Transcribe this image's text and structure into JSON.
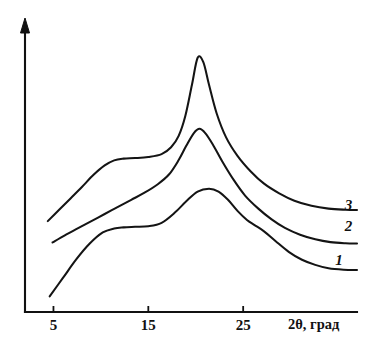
{
  "figure": {
    "background_color": "#ffffff",
    "ink_color": "#111111",
    "width": 368,
    "height": 349
  },
  "chart_data": {
    "type": "line",
    "title": "",
    "subtitle": "",
    "xlabel": "2θ, град",
    "ylabel": "",
    "xlim": [
      2,
      37
    ],
    "ylim": [
      0,
      100
    ],
    "grid": false,
    "legend_position": "inline-right-end-of-curve",
    "x_ticks": [
      5,
      15,
      25
    ],
    "x_tick_labels": [
      "5",
      "15",
      "25"
    ],
    "y_ticks": [],
    "y_tick_labels": [],
    "y_axis_arrow": true,
    "x_axis_arrow": false,
    "annotations": [
      {
        "text": "3",
        "x": 36.1,
        "y": 36.0,
        "style": "italic",
        "curve": "3"
      },
      {
        "text": "2",
        "x": 36.1,
        "y": 28.5,
        "style": "italic",
        "curve": "2"
      },
      {
        "text": "1",
        "x": 35.1,
        "y": 16.5,
        "style": "italic",
        "curve": "1"
      }
    ],
    "series": [
      {
        "name": "1",
        "label": "1",
        "color": "#141414",
        "description": "lowest curve, broad amorphous halo with weak shoulder near 26 deg",
        "x": [
          4.6,
          6.0,
          7.4,
          8.8,
          10.2,
          11.4,
          12.4,
          13.6,
          15.0,
          16.4,
          17.8,
          19.0,
          20.2,
          21.4,
          22.4,
          23.4,
          24.4,
          25.4,
          26.2,
          27.2,
          28.4,
          29.8,
          31.2,
          32.6,
          34.0,
          35.6,
          37.0
        ],
        "y": [
          5.5,
          12.0,
          18.5,
          24.0,
          28.0,
          29.4,
          29.8,
          30.0,
          30.2,
          31.4,
          35.0,
          39.0,
          42.4,
          43.4,
          42.4,
          39.5,
          35.6,
          32.4,
          30.6,
          28.4,
          25.0,
          21.2,
          18.4,
          16.6,
          15.4,
          14.9,
          14.8
        ]
      },
      {
        "name": "2",
        "label": "2",
        "color": "#141414",
        "description": "middle curve, moderate crystalline peak near 20 deg on broad halo",
        "x": [
          4.9,
          6.2,
          7.6,
          9.0,
          10.4,
          11.8,
          13.2,
          14.6,
          16.0,
          17.2,
          18.2,
          19.0,
          19.8,
          20.4,
          21.0,
          21.8,
          22.8,
          24.0,
          25.2,
          26.6,
          28.0,
          29.4,
          31.0,
          32.6,
          34.2,
          35.8,
          37.0
        ],
        "y": [
          24.5,
          27.0,
          29.5,
          32.0,
          34.5,
          37.0,
          39.5,
          42.0,
          45.0,
          48.5,
          53.5,
          58.5,
          63.0,
          64.5,
          63.0,
          59.0,
          53.0,
          46.5,
          41.0,
          36.4,
          32.6,
          29.6,
          27.2,
          25.6,
          24.6,
          24.2,
          24.1
        ]
      },
      {
        "name": "3",
        "label": "3",
        "color": "#141414",
        "description": "upper curve, sharp intense crystalline peak near 20 deg plus plateau near 12 deg",
        "x": [
          4.4,
          5.6,
          6.8,
          8.0,
          9.2,
          10.4,
          11.4,
          12.4,
          13.6,
          15.0,
          16.4,
          17.4,
          18.2,
          18.9,
          19.6,
          20.2,
          20.8,
          21.4,
          22.2,
          23.2,
          24.4,
          25.8,
          27.2,
          28.8,
          30.4,
          32.2,
          34.0,
          35.8,
          37.0
        ],
        "y": [
          32.0,
          36.0,
          40.0,
          44.0,
          48.2,
          51.6,
          53.4,
          54.0,
          54.2,
          54.6,
          55.6,
          58.0,
          62.0,
          69.0,
          80.0,
          89.5,
          88.0,
          80.0,
          70.0,
          61.5,
          55.0,
          49.5,
          45.2,
          41.8,
          39.2,
          37.4,
          36.4,
          36.0,
          35.9
        ]
      }
    ]
  }
}
